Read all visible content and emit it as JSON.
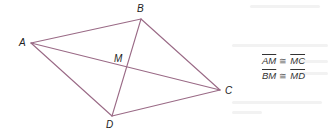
{
  "diagram": {
    "type": "quadrilateral-with-diagonals",
    "line_color": "#9a6a86",
    "vertices": [
      {
        "name": "A",
        "x": 31,
        "y": 43,
        "label_x": 19,
        "label_y": 38
      },
      {
        "name": "B",
        "x": 141,
        "y": 19,
        "label_x": 137,
        "label_y": 4
      },
      {
        "name": "C",
        "x": 220,
        "y": 90,
        "label_x": 225,
        "label_y": 86
      },
      {
        "name": "D",
        "x": 112,
        "y": 116,
        "label_x": 106,
        "label_y": 120
      }
    ],
    "intersection": {
      "name": "M",
      "x": 126,
      "y": 67,
      "label_x": 115,
      "label_y": 53
    },
    "sides": [
      [
        "A",
        "B"
      ],
      [
        "B",
        "C"
      ],
      [
        "C",
        "D"
      ],
      [
        "D",
        "A"
      ]
    ],
    "diagonals": [
      [
        "A",
        "C"
      ],
      [
        "B",
        "D"
      ]
    ]
  },
  "labels": {
    "A": "A",
    "B": "B",
    "C": "C",
    "D": "D",
    "M": "M"
  },
  "statements": [
    {
      "left": "AM",
      "symbol": "≅",
      "right": "MC"
    },
    {
      "left": "BM",
      "symbol": "≅",
      "right": "MD"
    }
  ]
}
